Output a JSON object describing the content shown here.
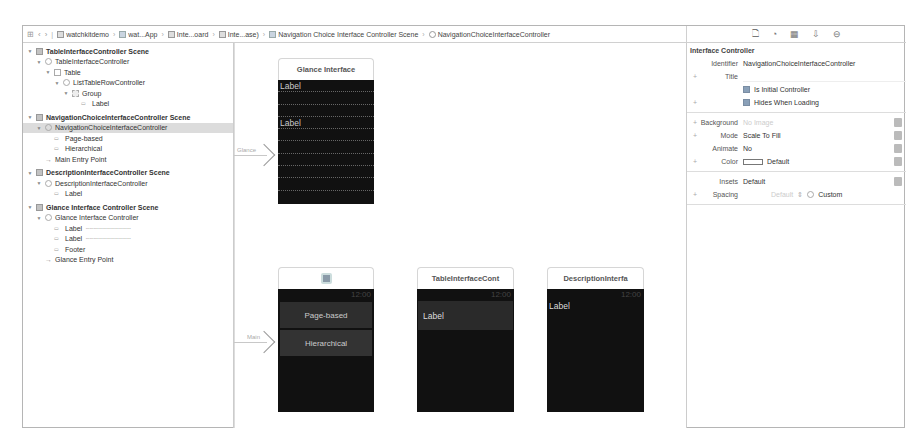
{
  "jumpbar": {
    "crumbs": [
      {
        "label": "watchkitdemo",
        "icon": "project-icon"
      },
      {
        "label": "wat...App",
        "icon": "folder-icon"
      },
      {
        "label": "Inte...oard",
        "icon": "storyboard-icon"
      },
      {
        "label": "Inte...ase)",
        "icon": "storyboard-base-icon"
      },
      {
        "label": "Navigation Choice Interface Controller Scene",
        "icon": "scene-icon"
      },
      {
        "label": "NavigationChoiceInterfaceController",
        "icon": "controller-icon"
      }
    ]
  },
  "inspector_tabs": [
    "file-inspector",
    "quick-help",
    "identity-inspector",
    "attributes-inspector",
    "connections-inspector"
  ],
  "outline": {
    "rows": [
      {
        "label": "TableInterfaceController Scene",
        "indent": 0,
        "kind": "scene",
        "tri": "▼"
      },
      {
        "label": "TableInterfaceController",
        "indent": 1,
        "kind": "circle",
        "tri": "▼"
      },
      {
        "label": "Table",
        "indent": 2,
        "kind": "sq",
        "tri": "▼"
      },
      {
        "label": "ListTableRowController",
        "indent": 3,
        "kind": "circle",
        "tri": "▼"
      },
      {
        "label": "Group",
        "indent": 4,
        "kind": "grp",
        "tri": "▼"
      },
      {
        "label": "Label",
        "indent": 5,
        "kind": "lbl",
        "tri": ""
      },
      {
        "label": "NavigationChoiceInterfaceController Scene",
        "indent": 0,
        "kind": "scene",
        "tri": "▼"
      },
      {
        "label": "NavigationChoiceInterfaceController",
        "indent": 1,
        "kind": "circle",
        "tri": "▼",
        "selected": true
      },
      {
        "label": "Page-based",
        "indent": 2,
        "kind": "lbl",
        "tri": ""
      },
      {
        "label": "Hierarchical",
        "indent": 2,
        "kind": "lbl",
        "tri": ""
      },
      {
        "label": "Main Entry Point",
        "indent": 1,
        "kind": "entry",
        "tri": ""
      },
      {
        "label": "DescriptionInterfaceController Scene",
        "indent": 0,
        "kind": "scene",
        "tri": "▼"
      },
      {
        "label": "DescriptionInterfaceController",
        "indent": 1,
        "kind": "circle",
        "tri": "▼"
      },
      {
        "label": "Label",
        "indent": 2,
        "kind": "lbl",
        "tri": ""
      },
      {
        "label": "Glance Interface Controller Scene",
        "indent": 0,
        "kind": "scene",
        "tri": "▼"
      },
      {
        "label": "Glance Interface Controller",
        "indent": 1,
        "kind": "circle",
        "tri": "▼"
      },
      {
        "label": "Label",
        "indent": 2,
        "kind": "lbl",
        "tri": "",
        "dots": "··································"
      },
      {
        "label": "Label",
        "indent": 2,
        "kind": "lbl",
        "tri": "",
        "dots": "··································"
      },
      {
        "label": "Footer",
        "indent": 2,
        "kind": "lbl",
        "tri": ""
      },
      {
        "label": "Glance Entry Point",
        "indent": 1,
        "kind": "entry",
        "tri": ""
      }
    ]
  },
  "canvas": {
    "glance": {
      "title": "Glance Interface",
      "label1": "Label",
      "label2": "Label",
      "segue_label": "Glance"
    },
    "navigation": {
      "time": "12:00",
      "button1": "Page-based",
      "button2": "Hierarchical",
      "segue_label": "Main"
    },
    "table": {
      "title": "TableInterfaceCont",
      "time": "12:00",
      "row_label": "Label"
    },
    "description": {
      "title": "DescriptionInterfa",
      "time": "12:00",
      "label": "Label"
    }
  },
  "inspector": {
    "section": "Interface Controller",
    "identifier_label": "Identifier",
    "identifier_value": "NavigationChoiceInterfaceController",
    "title_label": "Title",
    "title_value": "",
    "is_initial_label": "Is Initial Controller",
    "is_initial_checked": true,
    "hides_loading_label": "Hides When Loading",
    "hides_loading_checked": true,
    "background_label": "Background",
    "background_placeholder": "No Image",
    "mode_label": "Mode",
    "mode_value": "Scale To Fill",
    "animate_label": "Animate",
    "animate_value": "No",
    "color_label": "Color",
    "color_value": "Default",
    "insets_label": "Insets",
    "insets_value": "Default",
    "spacing_label": "Spacing",
    "spacing_placeholder": "Default",
    "spacing_custom_label": "Custom"
  }
}
